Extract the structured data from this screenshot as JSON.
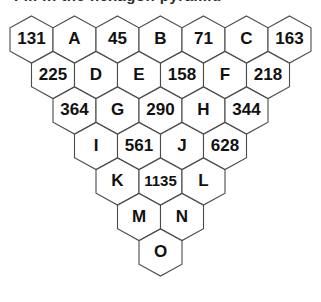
{
  "page": {
    "background_color": "#ffffff",
    "clipped_header_text": "Fill in the hexagon pyramid"
  },
  "diagram": {
    "type": "hexagon-pyramid",
    "row_count": 7,
    "orientation": "pointy-top",
    "hex_width": 43,
    "hex_height": 47,
    "row_step_y": 35.5,
    "row_indent_x": 21.5,
    "origin_x": 10,
    "origin_y": 16,
    "stroke_color": "#4a4a4a",
    "fill_color": "#ffffff",
    "text_color": "#111111",
    "rows": [
      {
        "index": 0,
        "count": 7,
        "cells": [
          {
            "id": "r0c0",
            "label": "131",
            "kind": "number"
          },
          {
            "id": "r0c1",
            "label": "A",
            "kind": "letter"
          },
          {
            "id": "r0c2",
            "label": "45",
            "kind": "number"
          },
          {
            "id": "r0c3",
            "label": "B",
            "kind": "letter"
          },
          {
            "id": "r0c4",
            "label": "71",
            "kind": "number"
          },
          {
            "id": "r0c5",
            "label": "C",
            "kind": "letter"
          },
          {
            "id": "r0c6",
            "label": "163",
            "kind": "number"
          }
        ]
      },
      {
        "index": 1,
        "count": 6,
        "cells": [
          {
            "id": "r1c0",
            "label": "225",
            "kind": "number"
          },
          {
            "id": "r1c1",
            "label": "D",
            "kind": "letter"
          },
          {
            "id": "r1c2",
            "label": "E",
            "kind": "letter"
          },
          {
            "id": "r1c3",
            "label": "158",
            "kind": "number"
          },
          {
            "id": "r1c4",
            "label": "F",
            "kind": "letter"
          },
          {
            "id": "r1c5",
            "label": "218",
            "kind": "number"
          }
        ]
      },
      {
        "index": 2,
        "count": 5,
        "cells": [
          {
            "id": "r2c0",
            "label": "364",
            "kind": "number"
          },
          {
            "id": "r2c1",
            "label": "G",
            "kind": "letter"
          },
          {
            "id": "r2c2",
            "label": "290",
            "kind": "number"
          },
          {
            "id": "r2c3",
            "label": "H",
            "kind": "letter"
          },
          {
            "id": "r2c4",
            "label": "344",
            "kind": "number"
          }
        ]
      },
      {
        "index": 3,
        "count": 4,
        "cells": [
          {
            "id": "r3c0",
            "label": "I",
            "kind": "letter"
          },
          {
            "id": "r3c1",
            "label": "561",
            "kind": "number"
          },
          {
            "id": "r3c2",
            "label": "J",
            "kind": "letter"
          },
          {
            "id": "r3c3",
            "label": "628",
            "kind": "number"
          }
        ]
      },
      {
        "index": 4,
        "count": 3,
        "cells": [
          {
            "id": "r4c0",
            "label": "K",
            "kind": "letter"
          },
          {
            "id": "r4c1",
            "label": "1135",
            "kind": "number"
          },
          {
            "id": "r4c2",
            "label": "L",
            "kind": "letter"
          }
        ]
      },
      {
        "index": 5,
        "count": 2,
        "cells": [
          {
            "id": "r5c0",
            "label": "M",
            "kind": "letter"
          },
          {
            "id": "r5c1",
            "label": "N",
            "kind": "letter"
          }
        ]
      },
      {
        "index": 6,
        "count": 1,
        "cells": [
          {
            "id": "r6c0",
            "label": "O",
            "kind": "letter"
          }
        ]
      }
    ]
  }
}
